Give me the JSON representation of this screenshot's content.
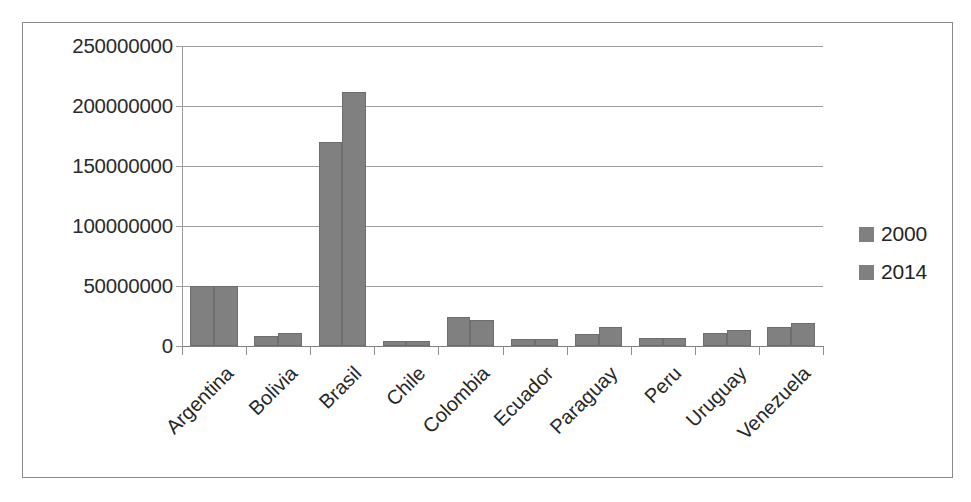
{
  "chart_data": {
    "type": "bar",
    "title": "",
    "subtitle": "",
    "xlabel": "",
    "ylabel": "",
    "grid": true,
    "legend_position": "right",
    "ylim": [
      0,
      250000000
    ],
    "yticks": [
      0,
      50000000,
      100000000,
      150000000,
      200000000,
      250000000
    ],
    "ytick_labels": [
      "0",
      "50000000",
      "100000000",
      "150000000",
      "200000000",
      "250000000"
    ],
    "categories": [
      "Argentina",
      "Bolivia",
      "Brasil",
      "Chile",
      "Colombia",
      "Ecuador",
      "Paraguay",
      "Peru",
      "Uruguay",
      "Venezuela"
    ],
    "series": [
      {
        "name": "2000",
        "color": "#808080",
        "values": [
          50000000,
          8000000,
          170000000,
          4000000,
          24000000,
          5500000,
          10000000,
          6500000,
          11000000,
          16000000
        ]
      },
      {
        "name": "2014",
        "color": "#808080",
        "values": [
          50000000,
          10500000,
          212000000,
          4500000,
          22000000,
          6000000,
          16000000,
          6500000,
          13000000,
          19000000
        ]
      }
    ]
  },
  "legend": {
    "items": [
      {
        "label": "2000",
        "color": "#808080"
      },
      {
        "label": "2014",
        "color": "#808080"
      }
    ]
  },
  "colors": {
    "bar_fill": "#808080",
    "gridline": "#9d9d9d",
    "axis": "#7d7d7d",
    "frame_border": "#8a8a8a",
    "text": "#262626",
    "background": "#ffffff"
  }
}
